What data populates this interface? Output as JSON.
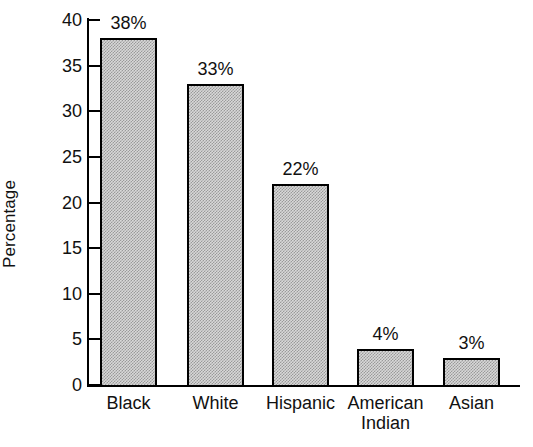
{
  "chart_data": {
    "type": "bar",
    "title": "",
    "subtitle": "",
    "xlabel": "",
    "ylabel": "Percentage",
    "categories": [
      "Black",
      "White",
      "Hispanic",
      "American Indian",
      "Asian"
    ],
    "category_lines": [
      [
        "Black"
      ],
      [
        "White"
      ],
      [
        "Hispanic"
      ],
      [
        "American",
        "Indian"
      ],
      [
        "Asian"
      ]
    ],
    "values": [
      38,
      33,
      22,
      4,
      3
    ],
    "data_labels": [
      "38%",
      "33%",
      "22%",
      "4%",
      "3%"
    ],
    "ylim": [
      0,
      40
    ],
    "ytick_values": [
      0,
      5,
      10,
      15,
      20,
      25,
      30,
      35,
      40
    ],
    "ytick_labels": [
      "0",
      "5",
      "10",
      "15",
      "20",
      "25",
      "30",
      "35",
      "40"
    ],
    "grid": false,
    "legend": null,
    "bar_fill": "#d8d8d8",
    "bar_pattern": "fine-checkerboard-stipple",
    "bar_edge_color": "#000000",
    "axis_color": "#000000",
    "background": "#ffffff",
    "text_color": "#111111"
  }
}
